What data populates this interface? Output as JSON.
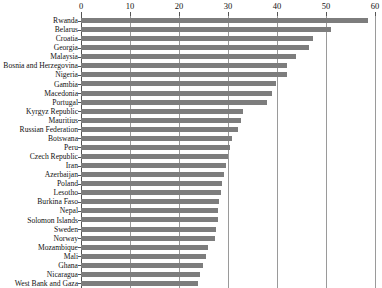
{
  "chart_data": {
    "type": "bar",
    "orientation": "horizontal",
    "title": "",
    "subtitle": "",
    "xlabel": "",
    "ylabel": "",
    "xlim": [
      0,
      60
    ],
    "xticks": [
      0,
      10,
      20,
      30,
      40,
      50,
      60
    ],
    "xtick_labels": [
      "0",
      "10",
      "20",
      "30",
      "40",
      "50",
      "60"
    ],
    "grid": "vertical",
    "legend": "none",
    "axis_position": "top",
    "bar_color": "#7d7d7d",
    "categories": [
      "Rwanda",
      "Belarus",
      "Croatia",
      "Georgia",
      "Malaysia",
      "Bosnia and Herzegovina",
      "Nigeria",
      "Gambia",
      "Macedonia",
      "Portugal",
      "Kyrgyz Republic",
      "Mauritius",
      "Russian Federation",
      "Botswana",
      "Peru",
      "Czech Republic",
      "Iran",
      "Azerbaijan",
      "Poland",
      "Lesotho",
      "Burkina Faso",
      "Nepal",
      "Solomon Islands",
      "Sweden",
      "Norway",
      "Mozambique",
      "Mali",
      "Ghana",
      "Nicaragua",
      "West Bank and Gaza"
    ],
    "values": [
      58.6,
      51.0,
      47.3,
      46.5,
      43.8,
      42.0,
      42.0,
      39.8,
      39.0,
      38.0,
      33.0,
      32.6,
      32.0,
      30.8,
      30.5,
      30.0,
      29.6,
      29.2,
      28.8,
      28.5,
      28.2,
      28.0,
      27.9,
      27.6,
      27.4,
      26.0,
      25.5,
      24.9,
      24.3,
      23.8
    ]
  }
}
